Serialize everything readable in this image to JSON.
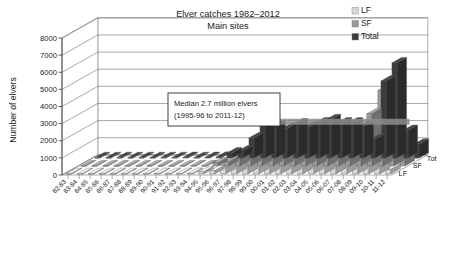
{
  "chart_data": {
    "type": "bar",
    "render": "3d-grouped-bar",
    "title": "Elver catches 1982–2012",
    "subtitle": "Main sites",
    "xlabel": "",
    "ylabel": "Number of elvers",
    "ylim": [
      0,
      8000
    ],
    "ytick_step": 1000,
    "yticks": [
      "8000",
      "7000",
      "6000",
      "5000",
      "4000",
      "3000",
      "2000",
      "1000",
      "0"
    ],
    "grid": true,
    "legend_position": "top-right",
    "depth_axis_labels": [
      "Tot",
      "SF",
      "LF"
    ],
    "categories": [
      "82-83",
      "83-84",
      "84-85",
      "85-86",
      "86-87",
      "87-88",
      "88-89",
      "89-90",
      "90-91",
      "91-92",
      "92-93",
      "93-94",
      "94-95",
      "95-96",
      "96-97",
      "97-98",
      "98-99",
      "99-00",
      "00-01",
      "01-02",
      "02-03",
      "03-04",
      "04-05",
      "05-06",
      "06-07",
      "07-08",
      "08-09",
      "09-10",
      "10-11",
      "11-12"
    ],
    "series": [
      {
        "name": "LF",
        "color": "#d8d8d8",
        "values": [
          20,
          15,
          20,
          15,
          20,
          15,
          20,
          20,
          25,
          20,
          25,
          30,
          120,
          180,
          560,
          900,
          700,
          480,
          600,
          520,
          560,
          700,
          650,
          700,
          620,
          400,
          1450,
          2050,
          520,
          260
        ]
      },
      {
        "name": "SF",
        "color": "#9a9a9a",
        "values": [
          10,
          10,
          10,
          10,
          10,
          10,
          10,
          10,
          10,
          10,
          15,
          20,
          180,
          240,
          620,
          1080,
          1180,
          1250,
          1400,
          1300,
          1500,
          1550,
          1400,
          1350,
          1250,
          680,
          3050,
          4420,
          1100,
          560
        ]
      },
      {
        "name": "Total",
        "color": "#3c3c3c",
        "values": [
          30,
          25,
          30,
          25,
          30,
          25,
          30,
          30,
          35,
          30,
          40,
          50,
          300,
          420,
          1180,
          1980,
          1880,
          1730,
          2000,
          1820,
          2060,
          2250,
          2050,
          2050,
          1870,
          1080,
          4500,
          5560,
          1620,
          820
        ]
      }
    ],
    "annotation": {
      "line1": "Median 2.7 million elvers",
      "line2": "(1995-96 to 2011-12)"
    },
    "median_band": {
      "label": "median reference band",
      "value": 2700,
      "color": "#8c8c8c"
    }
  },
  "legend": {
    "items": [
      {
        "label": "LF",
        "swatch": "#d8d8d8"
      },
      {
        "label": "SF",
        "swatch": "#9a9a9a"
      },
      {
        "label": "Total",
        "swatch": "#3c3c3c"
      }
    ]
  }
}
